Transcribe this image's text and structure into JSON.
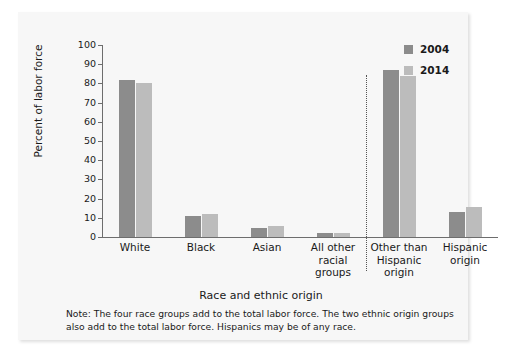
{
  "chart_data": {
    "type": "bar",
    "title": "",
    "xlabel": "Race and ethnic origin",
    "ylabel": "Percent of labor force",
    "ylim": [
      0,
      100
    ],
    "ytick_step": 10,
    "yticks": [
      "100",
      "90",
      "80",
      "70",
      "60",
      "50",
      "40",
      "30",
      "20",
      "10",
      "0"
    ],
    "grid": false,
    "legend_position": "top-right",
    "categories": [
      "White",
      "Black",
      "Asian",
      "All other\nracial\ngroups",
      "Other than\nHispanic\norigin",
      "Hispanic\norigin"
    ],
    "category_lines": [
      [
        "White"
      ],
      [
        "Black"
      ],
      [
        "Asian"
      ],
      [
        "All other",
        "racial",
        "groups"
      ],
      [
        "Other than",
        "Hispanic",
        "origin"
      ],
      [
        "Hispanic",
        "origin"
      ]
    ],
    "series": [
      {
        "name": "2004",
        "color": "#8c8c8c",
        "values": [
          82,
          11,
          4.5,
          2,
          87,
          13
        ]
      },
      {
        "name": "2014",
        "color": "#bcbcbc",
        "values": [
          80,
          12,
          5.5,
          2,
          84,
          15.5
        ]
      }
    ],
    "divider_after_category_index": 3,
    "note": "Note: The four race groups add to the total labor force. The two ethnic origin groups also add to the total labor force. Hispanics may be of any race."
  },
  "legend": {
    "items": [
      {
        "label": "2004"
      },
      {
        "label": "2014"
      }
    ]
  }
}
